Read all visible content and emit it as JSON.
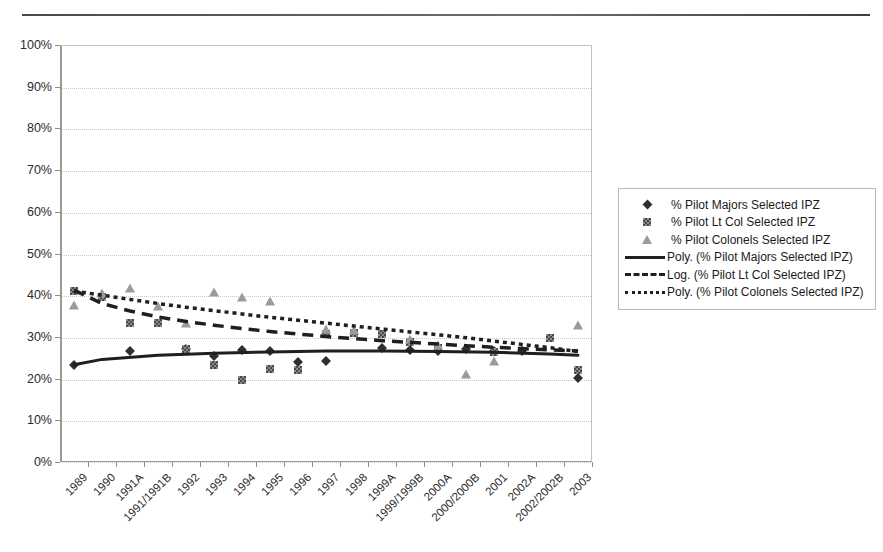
{
  "header": {
    "fragment_text": "",
    "rule": "horizontal-rule"
  },
  "chart_data": {
    "type": "scatter",
    "title": "",
    "xlabel": "",
    "ylabel": "",
    "ylim": [
      0,
      100
    ],
    "ytick_labels": [
      "0%",
      "10%",
      "20%",
      "30%",
      "40%",
      "50%",
      "60%",
      "70%",
      "80%",
      "90%",
      "100%"
    ],
    "ytick_values": [
      0,
      10,
      20,
      30,
      40,
      50,
      60,
      70,
      80,
      90,
      100
    ],
    "grid": true,
    "legend_position": "right",
    "categories": [
      "1989",
      "1990",
      "1991A",
      "1991/1991B",
      "1992",
      "1993",
      "1994",
      "1995",
      "1996",
      "1997",
      "1998",
      "1999A",
      "1999/1999B",
      "2000A",
      "2000/2000B",
      "2001",
      "2002A",
      "2002/2002B",
      "2003"
    ],
    "series": [
      {
        "name": "% Pilot Majors Selected IPZ",
        "marker": "diamond",
        "values": [
          23.2,
          null,
          26.5,
          null,
          27.2,
          25.5,
          26.8,
          26.7,
          23.9,
          24.2,
          null,
          27.3,
          26.9,
          26.6,
          27.0,
          26.6,
          26.7,
          null,
          20.1
        ]
      },
      {
        "name": "% Pilot Lt Col Selected IPZ",
        "marker": "square",
        "values": [
          41.0,
          39.6,
          33.4,
          33.3,
          27.0,
          23.2,
          19.6,
          22.4,
          22.0,
          30.6,
          31.0,
          30.8,
          28.8,
          27.4,
          null,
          26.3,
          null,
          29.7,
          22.0
        ]
      },
      {
        "name": "% Pilot Colonels Selected IPZ",
        "marker": "triangle",
        "values": [
          37.5,
          40.3,
          41.4,
          37.2,
          33.1,
          40.6,
          39.3,
          38.4,
          null,
          31.6,
          31.3,
          null,
          29.3,
          27.8,
          20.8,
          23.9,
          null,
          null,
          32.6
        ]
      }
    ],
    "trendlines": [
      {
        "name": "Poly. (% Pilot Majors Selected IPZ)",
        "style": "solid",
        "points": [
          [
            0,
            23.3
          ],
          [
            1,
            24.6
          ],
          [
            3,
            25.6
          ],
          [
            5,
            26.1
          ],
          [
            7,
            26.4
          ],
          [
            9,
            26.6
          ],
          [
            11,
            26.6
          ],
          [
            13,
            26.5
          ],
          [
            15,
            26.3
          ],
          [
            17,
            25.9
          ],
          [
            18,
            25.6
          ]
        ]
      },
      {
        "name": "Log. (% Pilot Lt Col Selected IPZ)",
        "style": "dashed",
        "points": [
          [
            0,
            41.2
          ],
          [
            1,
            38.0
          ],
          [
            2,
            36.2
          ],
          [
            3,
            34.8
          ],
          [
            4,
            33.7
          ],
          [
            5,
            32.8
          ],
          [
            6,
            32.0
          ],
          [
            7,
            31.3
          ],
          [
            8,
            30.7
          ],
          [
            9,
            30.1
          ],
          [
            10,
            29.6
          ],
          [
            11,
            29.1
          ],
          [
            12,
            28.7
          ],
          [
            13,
            28.3
          ],
          [
            14,
            27.9
          ],
          [
            15,
            27.5
          ],
          [
            16,
            27.2
          ],
          [
            17,
            26.9
          ],
          [
            18,
            26.6
          ]
        ]
      },
      {
        "name": "Poly. (% Pilot Colonels Selected IPZ)",
        "style": "dotted",
        "points": [
          [
            0,
            41.0
          ],
          [
            1,
            40.0
          ],
          [
            2,
            39.0
          ],
          [
            3,
            38.0
          ],
          [
            4,
            37.1
          ],
          [
            5,
            36.3
          ],
          [
            6,
            35.5
          ],
          [
            7,
            34.7
          ],
          [
            8,
            34.0
          ],
          [
            9,
            33.3
          ],
          [
            10,
            32.6
          ],
          [
            11,
            31.9
          ],
          [
            12,
            31.2
          ],
          [
            13,
            30.5
          ],
          [
            14,
            29.8
          ],
          [
            15,
            29.0
          ],
          [
            16,
            28.2
          ],
          [
            17,
            27.4
          ],
          [
            18,
            26.5
          ]
        ]
      }
    ]
  },
  "legend": {
    "items": [
      {
        "key": "diamond-marker",
        "label": "% Pilot Majors Selected IPZ"
      },
      {
        "key": "square-marker",
        "label": "% Pilot Lt Col Selected IPZ"
      },
      {
        "key": "triangle-marker",
        "label": "% Pilot Colonels Selected IPZ"
      },
      {
        "key": "solid-line",
        "label": "Poly. (% Pilot Majors Selected IPZ)"
      },
      {
        "key": "dashed-line",
        "label": "Log. (% Pilot Lt Col Selected IPZ)"
      },
      {
        "key": "dotted-line",
        "label": "Poly. (% Pilot Colonels Selected IPZ)"
      }
    ]
  },
  "colors": {
    "diamond": "#2e2e2e",
    "square": "#8a8a8a",
    "triangle": "#9b9b9b",
    "trend": "#1f1f1f",
    "grid": "#c9c9c9",
    "axis": "#9a9a9a"
  }
}
